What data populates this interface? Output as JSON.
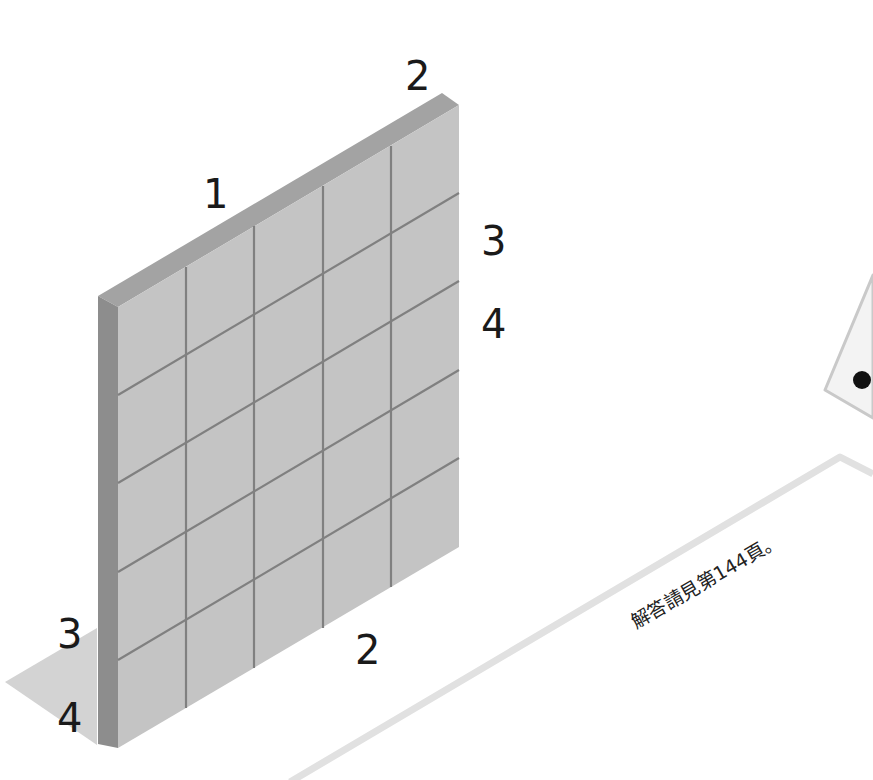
{
  "diagram": {
    "type": "isometric-grid-wall",
    "grid": {
      "columns": 5,
      "rows": 5
    },
    "edge_labels": {
      "top_left": "1",
      "top_right": "2",
      "right_upper": "3",
      "right_lower": "4",
      "left_upper": "3",
      "left_lower": "4",
      "bottom": "2"
    },
    "caption": "解答請見第144頁。",
    "colors": {
      "face": "#c4c4c4",
      "top_edge": "#a3a3a3",
      "side_edge": "#8c8c8c",
      "grid_line": "#7f7f7f",
      "shadow": "#d2d2d2",
      "guide_line": "#e2e2e2"
    }
  }
}
